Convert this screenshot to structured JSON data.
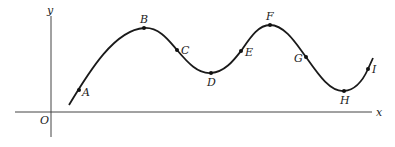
{
  "diagram": {
    "type": "function-graph",
    "axes": {
      "x_label": "x",
      "y_label": "y",
      "origin_label": "O",
      "color": "#444444"
    },
    "curve": {
      "color": "#1a1a1a",
      "description": "oscillating curve with local maxima at B and F and local minima at D and H"
    },
    "points": [
      {
        "id": "A",
        "label": "A",
        "x": 79,
        "y": 90,
        "lx": 82,
        "ly": 96
      },
      {
        "id": "B",
        "label": "B",
        "x": 144,
        "y": 28,
        "lx": 140,
        "ly": 23
      },
      {
        "id": "C",
        "label": "C",
        "x": 177,
        "y": 50,
        "lx": 181,
        "ly": 54
      },
      {
        "id": "D",
        "label": "D",
        "x": 211,
        "y": 73,
        "lx": 207,
        "ly": 86
      },
      {
        "id": "E",
        "label": "E",
        "x": 241,
        "y": 51,
        "lx": 245,
        "ly": 56
      },
      {
        "id": "F",
        "label": "F",
        "x": 270,
        "y": 25,
        "lx": 266,
        "ly": 20
      },
      {
        "id": "G",
        "label": "G",
        "x": 306,
        "y": 57,
        "lx": 294,
        "ly": 62
      },
      {
        "id": "H",
        "label": "H",
        "x": 344,
        "y": 91,
        "lx": 340,
        "ly": 104
      },
      {
        "id": "I",
        "label": "I",
        "x": 368,
        "y": 69,
        "lx": 372,
        "ly": 73
      }
    ]
  }
}
